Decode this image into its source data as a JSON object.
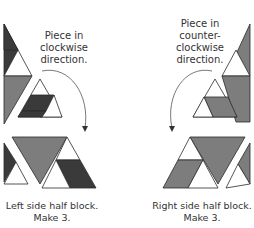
{
  "colors": {
    "dark": "#3a3a3a",
    "medium": "#7d7d7d",
    "light": "#ffffff",
    "outline": "#2a2a2a",
    "arrow": "#555555",
    "text": "#333333"
  },
  "left": {
    "annotation_line1": "Piece in",
    "annotation_line2": "clockwise",
    "annotation_line3": "direction.",
    "caption_line1": "Left side half block.",
    "caption_line2": "Make 3."
  },
  "right": {
    "annotation_line1": "Piece in",
    "annotation_line2": "counter-",
    "annotation_line3": "clockwise",
    "annotation_line4": "direction.",
    "caption_line1": "Right side half block.",
    "caption_line2": "Make 3."
  }
}
